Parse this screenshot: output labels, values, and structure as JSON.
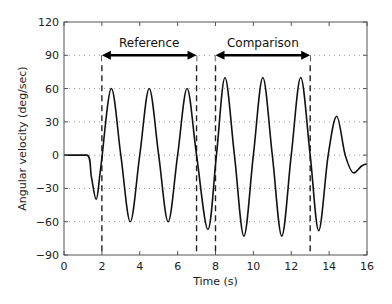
{
  "chart_data": {
    "type": "line",
    "title": "",
    "xlabel": "Time (s)",
    "ylabel": "Angular velocity (deg/sec)",
    "xlim": [
      0,
      16
    ],
    "ylim": [
      -90,
      120
    ],
    "xticks": [
      0,
      2,
      4,
      6,
      8,
      10,
      12,
      14,
      16
    ],
    "yticks": [
      -90,
      -60,
      -30,
      0,
      30,
      60,
      90,
      120
    ],
    "grid": "horizontal dotted",
    "legend": null,
    "series": [
      {
        "name": "Angular velocity",
        "color": "#111111",
        "x": [
          0,
          1.2,
          1.45,
          1.7,
          1.95,
          2.5,
          3.0,
          3.5,
          4.0,
          4.5,
          5.0,
          5.5,
          6.0,
          6.5,
          7.0,
          7.6,
          8.05,
          8.5,
          9.0,
          9.5,
          10.0,
          10.5,
          11.0,
          11.5,
          12.0,
          12.5,
          13.0,
          13.45,
          13.95,
          14.4,
          14.85,
          15.3,
          15.7,
          16.0
        ],
        "y": [
          0,
          0,
          -20,
          -40,
          -10,
          60,
          0,
          -60,
          0,
          60,
          0,
          -60,
          0,
          60,
          0,
          -67,
          0,
          70,
          0,
          -73,
          0,
          70,
          0,
          -73,
          0,
          70,
          0,
          -68,
          0,
          35,
          0,
          -16,
          -10,
          -8
        ]
      }
    ],
    "vertical_markers": [
      {
        "x": 2,
        "style": "dashed"
      },
      {
        "x": 7,
        "style": "dashed"
      },
      {
        "x": 8,
        "style": "dashed"
      },
      {
        "x": 13,
        "style": "dashed"
      }
    ],
    "annotations": [
      {
        "label": "Reference",
        "x_start": 2,
        "x_end": 7,
        "y": 90,
        "type": "double-arrow"
      },
      {
        "label": "Comparison",
        "x_start": 8,
        "x_end": 13,
        "y": 90,
        "type": "double-arrow"
      }
    ]
  }
}
